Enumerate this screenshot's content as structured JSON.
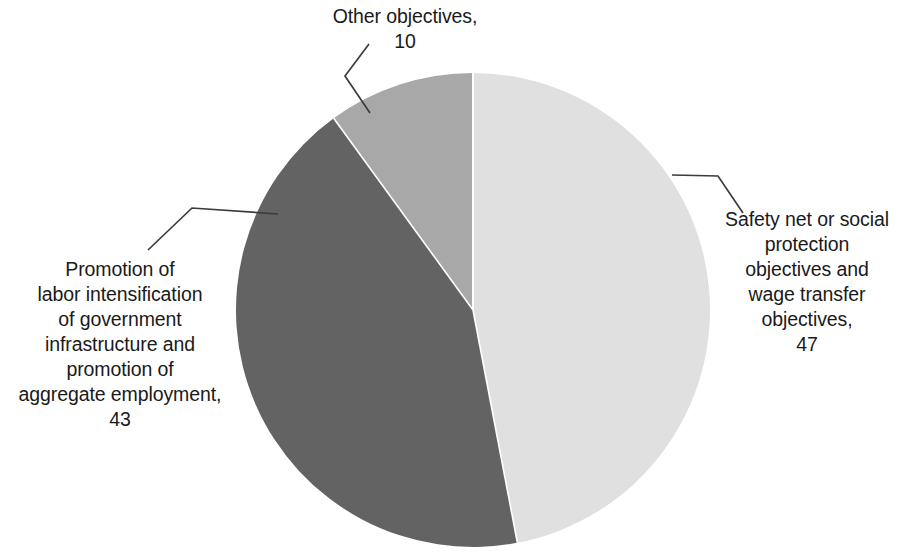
{
  "chart_data": {
    "type": "pie",
    "title": "",
    "subtitle": "",
    "xlabel": "",
    "ylabel": "",
    "legend_position": "none",
    "grid": false,
    "labels_inline": true,
    "start_angle_deg": 0,
    "direction": "clockwise",
    "categories": [
      "Safety net or social protection objectives and wage transfer objectives",
      "Promotion of labor intensification of government infrastructure and promotion of aggregate employment",
      "Other objectives"
    ],
    "values": [
      47,
      43,
      10
    ],
    "total": 100,
    "slices": [
      {
        "name": "Safety net or social protection objectives and wage transfer objectives",
        "value": 47,
        "color": "#e0e0e0",
        "start_deg": 0,
        "end_deg": 169.2,
        "label_text": "Safety net or social\nprotection\nobjectives and\nwage transfer\nobjectives,\n47"
      },
      {
        "name": "Promotion of labor intensification of government infrastructure and promotion of aggregate employment",
        "value": 43,
        "color": "#636363",
        "start_deg": 169.2,
        "end_deg": 324.0,
        "label_text": "Promotion of\nlabor intensification\nof government\ninfrastructure and\npromotion of\naggregate employment,\n43"
      },
      {
        "name": "Other objectives",
        "value": 10,
        "color": "#a8a8a8",
        "start_deg": 324.0,
        "end_deg": 360.0,
        "label_text": "Other objectives,\n10"
      }
    ]
  },
  "colors": {
    "slice_light": "#e0e0e0",
    "slice_dark": "#636363",
    "slice_medium": "#a8a8a8",
    "leader_line": "#3c3c3c",
    "slice_separator": "#ffffff",
    "text": "#1a1a1a",
    "background": "#ffffff"
  },
  "labels": {
    "other_objectives": "Other objectives,\n10",
    "safety_net": "Safety net or social\nprotection\nobjectives and\nwage transfer\nobjectives,\n47",
    "promotion_labor": "Promotion of\nlabor intensification\nof government\ninfrastructure and\npromotion of\naggregate employment,\n43"
  }
}
